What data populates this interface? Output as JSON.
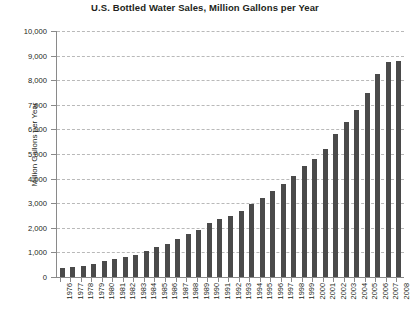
{
  "chart_data": {
    "type": "bar",
    "title": "U.S. Bottled Water Sales, Million Gallons per Year",
    "xlabel": "",
    "ylabel": "Million Gallons per Year",
    "ylim": [
      0,
      10000
    ],
    "ytick_step": 1000,
    "ytick_labels": [
      "0",
      "1,000",
      "2,000",
      "3,000",
      "4,000",
      "5,000",
      "6,000",
      "7,000",
      "8,000",
      "9,000",
      "10,000"
    ],
    "grid": true,
    "legend": "none",
    "bar_color": "#4a4a4a",
    "gridline_color": "#b9b9b9",
    "axis_color": "#8a8a8a",
    "categories": [
      "1976",
      "1977",
      "1978",
      "1979",
      "1980",
      "1981",
      "1982",
      "1983",
      "1984",
      "1985",
      "1986",
      "1987",
      "1988",
      "1989",
      "1990",
      "1991",
      "1992",
      "1993",
      "1994",
      "1995",
      "1996",
      "1997",
      "1998",
      "1999",
      "2000",
      "2001",
      "2002",
      "2003",
      "2004",
      "2005",
      "2006",
      "2007",
      "2008"
    ],
    "values": [
      354,
      420,
      450,
      520,
      640,
      720,
      810,
      900,
      1050,
      1200,
      1350,
      1550,
      1750,
      1900,
      2200,
      2350,
      2500,
      2700,
      2950,
      3200,
      3500,
      3800,
      4100,
      4500,
      4800,
      5200,
      5800,
      6300,
      6800,
      7500,
      8250,
      8750,
      8800
    ],
    "units": "million gallons"
  },
  "source_note": ""
}
